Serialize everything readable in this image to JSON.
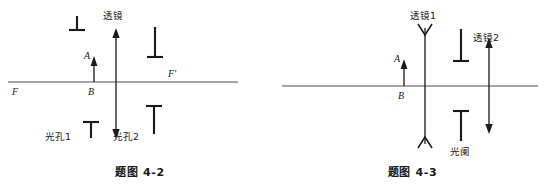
{
  "sheet": {
    "title": "光学作图题 题图 4-2 与 题图 4-3"
  },
  "figures": [
    {
      "id": "fig-4-2",
      "caption": "题图 4-2",
      "axis": {
        "left_focus_label": "F",
        "right_focus_label": "F'"
      },
      "object": {
        "tip_label": "A",
        "base_label": "B"
      },
      "lens": {
        "label": "透镜",
        "type": "double-headed-arrow"
      },
      "stops": [
        {
          "label": "光孔1",
          "glyph": "T"
        },
        {
          "label": "光孔2",
          "glyph": "T"
        }
      ],
      "unlabeled_marks": [
        {
          "glyph": "⊥",
          "position": "upper-left"
        },
        {
          "glyph": "⊥",
          "position": "upper-right"
        }
      ]
    },
    {
      "id": "fig-4-3",
      "caption": "题图 4-3",
      "object": {
        "tip_label": "A",
        "base_label": "B"
      },
      "lenses": [
        {
          "label": "透镜1",
          "type": "concave-v-arrow"
        },
        {
          "label": "透镜2",
          "type": "double-headed-arrow"
        }
      ],
      "stops": [
        {
          "label": "光阑",
          "glyph": "T"
        }
      ]
    }
  ],
  "colors": {
    "ink": "#1a1a1a",
    "axis": "#4c4c4c",
    "paper": "#ffffff"
  }
}
